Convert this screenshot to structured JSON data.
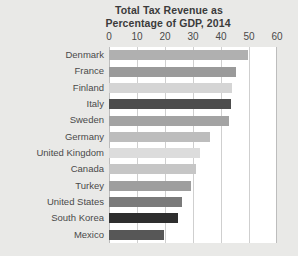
{
  "chart_data": {
    "type": "bar",
    "orientation": "horizontal",
    "title": "Total Tax Revenue as Percentage of GDP, 2014",
    "title_lines": [
      "Total Tax Revenue as",
      "Percentage of GDP, 2014"
    ],
    "xlabel": "",
    "ylabel": "",
    "xlim": [
      0,
      60
    ],
    "xticks": [
      0,
      10,
      20,
      30,
      40,
      50,
      60
    ],
    "xtick_labels": [
      "0",
      "10",
      "20",
      "30",
      "40",
      "50",
      "60"
    ],
    "grid": true,
    "legend": "none",
    "categories": [
      "Denmark",
      "France",
      "Finland",
      "Italy",
      "Sweden",
      "Germany",
      "United Kingdom",
      "Canada",
      "Turkey",
      "United States",
      "South Korea",
      "Mexico"
    ],
    "values": [
      49.6,
      45.2,
      43.9,
      43.6,
      42.7,
      36.1,
      32.6,
      31.2,
      29.3,
      26.0,
      24.6,
      19.5
    ],
    "bar_colors": [
      "#b0b0b0",
      "#9a9a9a",
      "#d5d5d5",
      "#4d4d4d",
      "#a3a3a3",
      "#bdbdbd",
      "#dcdcdc",
      "#c6c6c6",
      "#9e9e9e",
      "#7a7a7a",
      "#2e2e2e",
      "#575757"
    ]
  },
  "style": {
    "background": "#e9e9e7",
    "plot_background": "#ffffff",
    "grid_color": "#cfcfcf",
    "text_color": "#4a4a4a",
    "title_color": "#3b3b3b"
  }
}
